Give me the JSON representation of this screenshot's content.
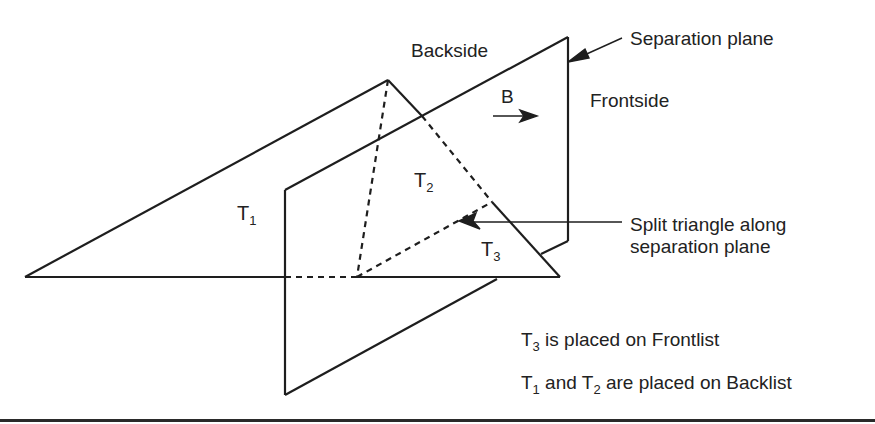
{
  "figure": {
    "labels": {
      "backside": "Backside",
      "frontside": "Frontside",
      "b_vector": "B",
      "separation_plane": "Separation plane",
      "split_line1": "Split triangle along",
      "split_line2": "separation plane"
    },
    "triangles": [
      {
        "name": "T",
        "sub": "1"
      },
      {
        "name": "T",
        "sub": "2"
      },
      {
        "name": "T",
        "sub": "3"
      }
    ],
    "notes": {
      "frontlist": {
        "t": "T",
        "sub": "3",
        "text": " is placed on Frontlist"
      },
      "backlist": {
        "t1": "T",
        "sub1": "1",
        "and": " and ",
        "t2": "T",
        "sub2": "2",
        "text": " are placed on Backlist"
      }
    },
    "colors": {
      "stroke": "#1e1e1e",
      "text": "#222222",
      "background": "#ffffff"
    }
  }
}
